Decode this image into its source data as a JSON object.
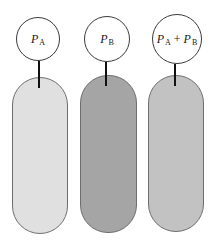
{
  "diagram": {
    "units": [
      {
        "id": "A",
        "label_parts": {
          "p1": "P",
          "s1": "A",
          "op": "",
          "p2": "",
          "s2": ""
        },
        "fill_color": "#e0e0e0",
        "bubble": {
          "cx": 38,
          "cy": 39,
          "r": 22
        },
        "stem": {
          "x": 39,
          "top": 61,
          "bottom": 88
        },
        "pill": {
          "left": 12,
          "top": 77,
          "width": 56,
          "bottom": 234
        }
      },
      {
        "id": "B",
        "label_parts": {
          "p1": "P",
          "s1": "B",
          "op": "",
          "p2": "",
          "s2": ""
        },
        "fill_color": "#a5a5a5",
        "bubble": {
          "cx": 107,
          "cy": 39,
          "r": 23
        },
        "stem": {
          "x": 106,
          "top": 62,
          "bottom": 86
        },
        "pill": {
          "left": 80,
          "top": 75,
          "width": 57,
          "bottom": 233
        }
      },
      {
        "id": "A+B",
        "label_parts": {
          "p1": "P",
          "s1": "A",
          "op": "+",
          "p2": "P",
          "s2": "B"
        },
        "fill_color": "#c2c2c2",
        "bubble": {
          "cx": 177,
          "cy": 39,
          "r": 25
        },
        "stem": {
          "x": 175,
          "top": 64,
          "bottom": 86
        },
        "pill": {
          "left": 148,
          "top": 75,
          "width": 56,
          "bottom": 232
        }
      }
    ]
  },
  "colors": {
    "outline": "#6e6e6e",
    "stem": "#111111",
    "bubble_border": "#3a3a3a",
    "background": "#ffffff"
  }
}
